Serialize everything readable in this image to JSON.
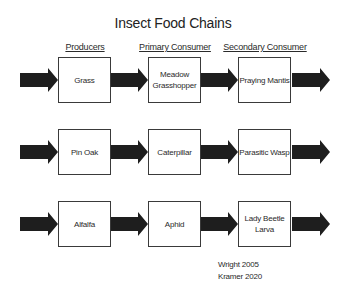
{
  "title": "Insect Food Chains",
  "columns": [
    "Producers",
    "Primary Consumer",
    "Secondary Consumer"
  ],
  "rows": [
    {
      "producer": "Grass",
      "primary": "Meadow Grasshopper",
      "secondary": "Praying Mantis"
    },
    {
      "producer": "Pin Oak",
      "primary": "Caterpillar",
      "secondary": "Parasitic Wasp"
    },
    {
      "producer": "Alfalfa",
      "primary": "Aphid",
      "secondary": "Lady Beetle Larva"
    }
  ],
  "citations": [
    "Wright 2005",
    "Kramer 2020"
  ],
  "colors": {
    "arrow": "#1e1e1e",
    "box_border": "#3a3a3a"
  }
}
